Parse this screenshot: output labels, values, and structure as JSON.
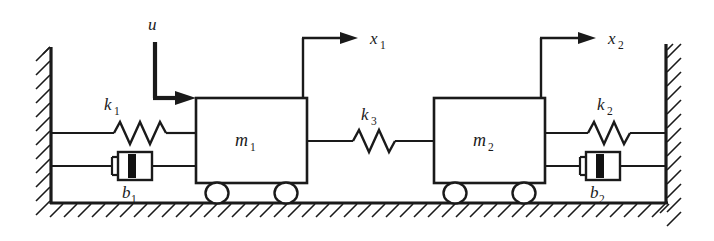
{
  "diagram": {
    "type": "mechanical-schematic",
    "background_color": "#ffffff",
    "line_color": "#1a1a1a",
    "labels": {
      "input_force": {
        "symbol": "u",
        "subscript": ""
      },
      "displacement_1": {
        "symbol": "x",
        "subscript": "1"
      },
      "displacement_2": {
        "symbol": "x",
        "subscript": "2"
      },
      "mass_1": {
        "symbol": "m",
        "subscript": "1"
      },
      "mass_2": {
        "symbol": "m",
        "subscript": "2"
      },
      "spring_1": {
        "symbol": "k",
        "subscript": "1"
      },
      "spring_2": {
        "symbol": "k",
        "subscript": "2"
      },
      "spring_3": {
        "symbol": "k",
        "subscript": "3"
      },
      "damper_1": {
        "symbol": "b",
        "subscript": "1"
      },
      "damper_2": {
        "symbol": "b",
        "subscript": "2"
      }
    },
    "components": [
      {
        "name": "left-wall",
        "kind": "fixed-support",
        "hatched": true
      },
      {
        "name": "right-wall",
        "kind": "fixed-support",
        "hatched": true
      },
      {
        "name": "ground",
        "kind": "fixed-support",
        "hatched": true
      },
      {
        "name": "spring-k1",
        "kind": "spring",
        "connects": "left-wall to mass-m1"
      },
      {
        "name": "damper-b1",
        "kind": "damper",
        "connects": "left-wall to mass-m1"
      },
      {
        "name": "mass-m1",
        "kind": "mass",
        "wheels": 2
      },
      {
        "name": "spring-k3",
        "kind": "spring",
        "connects": "mass-m1 to mass-m2"
      },
      {
        "name": "mass-m2",
        "kind": "mass",
        "wheels": 2
      },
      {
        "name": "spring-k2",
        "kind": "spring",
        "connects": "mass-m2 to right-wall"
      },
      {
        "name": "damper-b2",
        "kind": "damper",
        "connects": "mass-m2 to right-wall"
      },
      {
        "name": "input-arrow-u",
        "kind": "force-arrow",
        "applied_to": "mass-m1",
        "direction": "right"
      },
      {
        "name": "reference-arrow-x1",
        "kind": "displacement-arrow",
        "measures": "mass-m1",
        "direction": "right"
      },
      {
        "name": "reference-arrow-x2",
        "kind": "displacement-arrow",
        "measures": "mass-m2",
        "direction": "right"
      }
    ]
  }
}
